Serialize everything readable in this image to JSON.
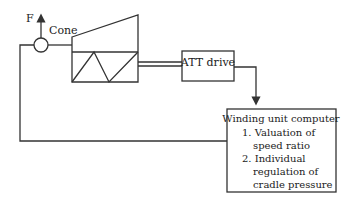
{
  "diagram": {
    "force_label": "F",
    "cone_label": "Cone",
    "att_drive": {
      "label": "ATT drive"
    },
    "computer": {
      "title": "Winding unit computer",
      "lines": [
        "1. Valuation of",
        "speed ratio",
        "2. Individual",
        "regulation of",
        "cradle pressure"
      ]
    },
    "colors": {
      "stroke": "#333333",
      "text": "#222222",
      "background": "#ffffff"
    }
  }
}
